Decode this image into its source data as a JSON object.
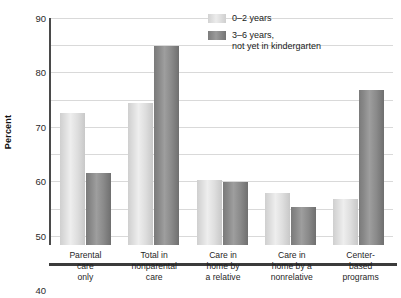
{
  "chart_data": {
    "type": "bar",
    "title": "",
    "xlabel": "",
    "ylabel": "Percent",
    "ylim": [
      0,
      90
    ],
    "yticks": [
      0,
      10,
      20,
      30,
      40,
      50,
      60,
      70,
      80,
      90
    ],
    "grid": true,
    "legend_position": "top-right",
    "categories": [
      "Parental\ncare\nonly",
      "Total in\nnonparental\ncare",
      "Care in\nhome by\na relative",
      "Care in\nhome by a\nnonrelative",
      "Center-\nbased\nprograms"
    ],
    "series": [
      {
        "name": "0–2 years",
        "color": "#dcdcdc",
        "values": [
          48.5,
          52,
          24,
          19,
          17
        ]
      },
      {
        "name": "3–6 years,\nnot yet in kindergarten",
        "color": "#8a8a8a",
        "values": [
          26.5,
          73,
          23,
          14,
          57
        ]
      }
    ]
  },
  "axis": {
    "ylabel": "Percent"
  }
}
